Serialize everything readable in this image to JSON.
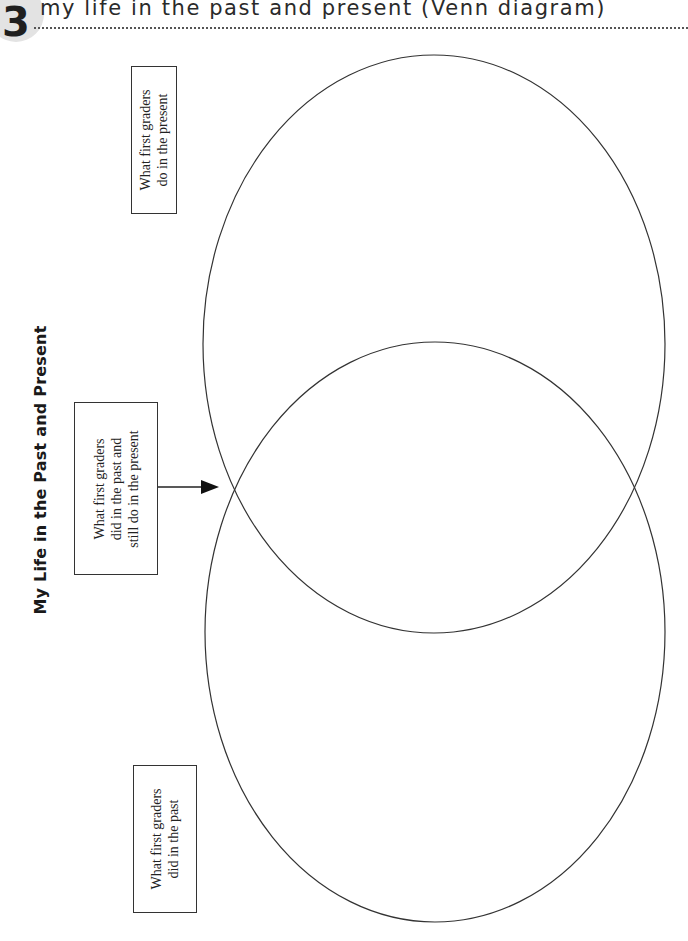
{
  "header": {
    "number": "3",
    "title": "my life in the past and present (Venn diagram)"
  },
  "diagram": {
    "title": "My Life in the Past and Present",
    "labels": {
      "present": [
        "What first graders",
        "do in the present"
      ],
      "both": [
        "What first graders",
        "did in the past and",
        "still do in the present"
      ],
      "past": [
        "What first graders",
        "did in the past"
      ]
    },
    "circles": [
      {
        "name": "present",
        "cx": 434,
        "cy": 344,
        "rx": 231,
        "ry": 289
      },
      {
        "name": "past",
        "cx": 435,
        "cy": 632,
        "rx": 230,
        "ry": 290
      }
    ],
    "arrow": {
      "x1": 158,
      "y1": 487,
      "x2": 218,
      "y2": 487
    },
    "colors": {
      "line": "#333333",
      "badge": "#e3e3e3"
    }
  }
}
